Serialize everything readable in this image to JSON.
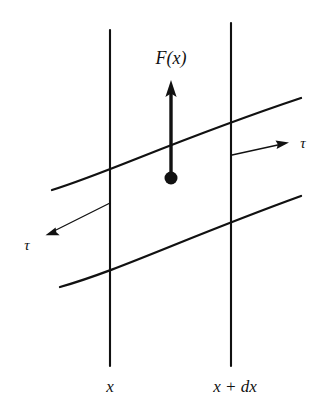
{
  "figure": {
    "background_color": "#ffffff",
    "ink_color": "#111111",
    "labels": {
      "force": "F(x)",
      "tau_right": "τ",
      "tau_left": "τ",
      "x_left": "x",
      "x_right": "x + dx"
    },
    "geometry": {
      "canvas": {
        "width": 329,
        "height": 420
      },
      "vertical_line_left": {
        "x": 110,
        "y_top": 30,
        "y_bottom": 366
      },
      "vertical_line_right": {
        "x": 231,
        "y_top": 23,
        "y_bottom": 366
      },
      "top_curve": {
        "x_start": 52,
        "y_start": 190,
        "x_end": 301,
        "y_end": 98
      },
      "bottom_curve": {
        "x_start": 60,
        "y_start": 287,
        "x_end": 301,
        "y_end": 196
      },
      "force_arrow": {
        "x": 171,
        "y_tail": 178,
        "y_tip": 82
      },
      "force_dot": {
        "cx": 171,
        "cy": 178,
        "r": 6.5
      },
      "tau_arrow_right": {
        "x_start": 232,
        "y_start": 155,
        "x_end": 288,
        "y_end": 143
      },
      "tau_arrow_left": {
        "x_start": 110,
        "y_start": 203,
        "x_end": 46,
        "y_end": 235
      },
      "label_force_pos": {
        "x": 171,
        "y": 64
      },
      "label_tau_right_pos": {
        "x": 303,
        "y": 148
      },
      "label_tau_left_pos": {
        "x": 27,
        "y": 250
      },
      "label_x_left_pos": {
        "x": 110,
        "y": 392
      },
      "label_x_right_pos": {
        "x": 235,
        "y": 392
      }
    }
  }
}
